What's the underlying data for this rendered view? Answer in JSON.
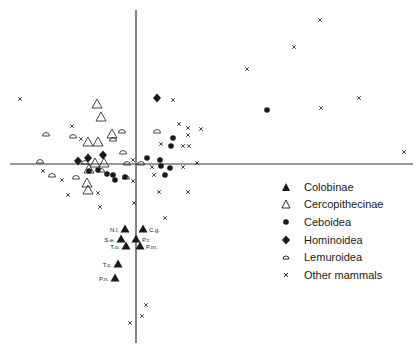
{
  "chart_data": {
    "type": "scatter",
    "title": "",
    "xlabel": "",
    "ylabel": "",
    "grid": false,
    "legend_position": "right-middle",
    "axes_pixel": {
      "x_axis_y": 164,
      "x_axis_from": 10,
      "x_axis_to": 413,
      "y_axis_x": 136,
      "y_axis_from": 10,
      "y_axis_to": 343
    },
    "series": [
      {
        "name": "Colobinae",
        "marker": "filled-triangle",
        "points": [
          [
            125,
            229
          ],
          [
            143,
            229
          ],
          [
            121,
            239
          ],
          [
            136,
            239
          ],
          [
            126,
            246
          ],
          [
            140,
            246
          ],
          [
            118,
            264
          ],
          [
            115,
            278
          ]
        ],
        "labels": [
          "N.l.",
          "C.g.",
          "S.e.",
          "P.r.",
          "T.o.",
          "P.m.",
          "T.c.",
          "P.n."
        ]
      },
      {
        "name": "Cercopithecinae",
        "marker": "open-triangle",
        "points": [
          [
            97,
            104
          ],
          [
            101,
            117
          ],
          [
            88,
            142
          ],
          [
            98,
            142
          ],
          [
            112,
            134
          ],
          [
            95,
            163
          ],
          [
            104,
            163
          ],
          [
            89,
            169
          ],
          [
            87,
            183
          ],
          [
            88,
            190
          ]
        ]
      },
      {
        "name": "Ceboidea",
        "marker": "filled-circle",
        "points": [
          [
            173,
            138
          ],
          [
            171,
            146
          ],
          [
            147,
            158
          ],
          [
            160,
            160
          ],
          [
            161,
            166
          ],
          [
            170,
            168
          ],
          [
            165,
            175
          ],
          [
            89,
            171
          ],
          [
            98,
            170
          ],
          [
            107,
            174
          ],
          [
            113,
            175
          ],
          [
            115,
            180
          ],
          [
            125,
            177
          ],
          [
            267,
            110
          ]
        ]
      },
      {
        "name": "Hominoidea",
        "marker": "filled-diamond",
        "points": [
          [
            78,
            161
          ],
          [
            88,
            158
          ],
          [
            103,
            155
          ],
          [
            157,
            98
          ]
        ]
      },
      {
        "name": "Lemuroidea",
        "marker": "half-circle",
        "points": [
          [
            46,
            134
          ],
          [
            73,
            136
          ],
          [
            40,
            161
          ],
          [
            52,
            175
          ],
          [
            85,
            162
          ],
          [
            101,
            170
          ],
          [
            113,
            139
          ],
          [
            122,
            131
          ],
          [
            123,
            152
          ],
          [
            127,
            163
          ],
          [
            126,
            177
          ],
          [
            157,
            131
          ],
          [
            141,
            163
          ],
          [
            76,
            177
          ]
        ]
      },
      {
        "name": "Other mammals",
        "marker": "x",
        "points": [
          [
            20,
            99
          ],
          [
            72,
            126
          ],
          [
            81,
            139
          ],
          [
            43,
            171
          ],
          [
            62,
            180
          ],
          [
            68,
            195
          ],
          [
            98,
            193
          ],
          [
            100,
            207
          ],
          [
            133,
            160
          ],
          [
            173,
            100
          ],
          [
            179,
            124
          ],
          [
            188,
            128
          ],
          [
            188,
            135
          ],
          [
            201,
            129
          ],
          [
            189,
            146
          ],
          [
            161,
            144
          ],
          [
            183,
            146
          ],
          [
            183,
            167
          ],
          [
            152,
            167
          ],
          [
            197,
            163
          ],
          [
            154,
            175
          ],
          [
            133,
            181
          ],
          [
            159,
            192
          ],
          [
            188,
            192
          ],
          [
            165,
            218
          ],
          [
            134,
            203
          ],
          [
            404,
            152
          ],
          [
            320,
            20
          ],
          [
            294,
            47
          ],
          [
            247,
            69
          ],
          [
            359,
            98
          ],
          [
            321,
            108
          ],
          [
            146,
            305
          ],
          [
            142,
            316
          ],
          [
            130,
            323
          ]
        ]
      }
    ]
  },
  "legend": {
    "items": [
      {
        "label": "Colobinae",
        "icon": "filled-triangle-icon"
      },
      {
        "label": "Cercopithecinae",
        "icon": "open-triangle-icon"
      },
      {
        "label": "Ceboidea",
        "icon": "filled-circle-icon"
      },
      {
        "label": "Hominoidea",
        "icon": "filled-diamond-icon"
      },
      {
        "label": "Lemuroidea",
        "icon": "half-circle-icon"
      },
      {
        "label": "Other mammals",
        "icon": "x-mark-icon"
      }
    ]
  },
  "colors": {
    "ink": "#1a1a1a",
    "background": "#ffffff"
  }
}
